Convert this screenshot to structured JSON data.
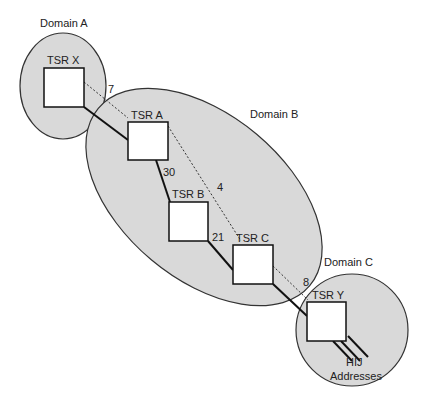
{
  "diagram": {
    "type": "network-topology",
    "colors": {
      "background": "#ffffff",
      "domain_fill": "#d9d9d9",
      "domain_stroke": "#333333",
      "node_fill": "#ffffff",
      "link_solid": "#111111",
      "link_dotted": "#333333",
      "text": "#222222"
    },
    "domains": [
      {
        "id": "A",
        "label": "Domain A"
      },
      {
        "id": "B",
        "label": "Domain B"
      },
      {
        "id": "C",
        "label": "Domain C"
      }
    ],
    "nodes": [
      {
        "id": "X",
        "label": "TSR X",
        "domain": "A"
      },
      {
        "id": "A",
        "label": "TSR A",
        "domain": "B"
      },
      {
        "id": "B",
        "label": "TSR B",
        "domain": "B"
      },
      {
        "id": "C",
        "label": "TSR C",
        "domain": "B"
      },
      {
        "id": "Y",
        "label": "TSR Y",
        "domain": "C"
      }
    ],
    "links": [
      {
        "from": "X",
        "to": "A",
        "style": "solid"
      },
      {
        "from": "A",
        "to": "B",
        "style": "solid",
        "label": "30"
      },
      {
        "from": "B",
        "to": "C",
        "style": "solid",
        "label": "21"
      },
      {
        "from": "C",
        "to": "Y",
        "style": "solid"
      }
    ],
    "tunnels": [
      {
        "from": "X",
        "to": "A",
        "style": "dotted",
        "label": "7"
      },
      {
        "from": "A",
        "to": "C",
        "style": "dotted",
        "label": "4"
      },
      {
        "from": "C",
        "to": "Y",
        "style": "dotted",
        "label": "8"
      }
    ],
    "addresses": {
      "line1": "HIJ",
      "line2": "Addresses"
    }
  }
}
